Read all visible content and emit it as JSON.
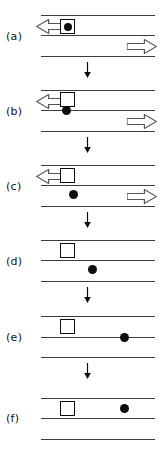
{
  "figure": {
    "width": 167,
    "height": 464,
    "background": "#ffffff",
    "line_color": "#3c3c3c",
    "glyph_color": "#0d0d0d",
    "arrow_outline_color": "#555555",
    "arrow_fill_color": "#ffffff"
  },
  "panels": [
    {
      "label": "(a)",
      "label_x": 6,
      "label_y": 30,
      "top": 0,
      "lines": [
        {
          "x": 41,
          "y": 15,
          "width": 114
        },
        {
          "x": 41,
          "y": 35,
          "width": 114
        },
        {
          "x": 41,
          "y": 56,
          "width": 114
        }
      ],
      "left_arrow": {
        "x": 36,
        "y": 19,
        "width": 30,
        "height": 15,
        "direction": "left"
      },
      "right_arrow": {
        "x": 127,
        "y": 39,
        "width": 30,
        "height": 15,
        "direction": "right"
      },
      "square": {
        "x": 60,
        "y": 19,
        "size": 15,
        "has_inner_circle": true,
        "inner_circle_size": 8
      },
      "circle": null,
      "transition_arrow": {
        "x": 83,
        "y": 62,
        "height": 16
      }
    },
    {
      "label": "(b)",
      "label_x": 6,
      "label_y": 105,
      "top": 0,
      "lines": [
        {
          "x": 41,
          "y": 90,
          "width": 114
        },
        {
          "x": 41,
          "y": 110,
          "width": 114
        },
        {
          "x": 41,
          "y": 131,
          "width": 114
        }
      ],
      "left_arrow": {
        "x": 36,
        "y": 94,
        "width": 30,
        "height": 15,
        "direction": "left"
      },
      "right_arrow": {
        "x": 127,
        "y": 114,
        "width": 30,
        "height": 15,
        "direction": "right"
      },
      "square": {
        "x": 60,
        "y": 92,
        "size": 15,
        "has_inner_circle": false,
        "inner_circle_size": 0
      },
      "circle": {
        "x": 62,
        "y": 106,
        "size": 9
      },
      "transition_arrow": {
        "x": 83,
        "y": 137,
        "height": 16
      }
    },
    {
      "label": "(c)",
      "label_x": 6,
      "label_y": 180,
      "top": 0,
      "lines": [
        {
          "x": 41,
          "y": 165,
          "width": 114
        },
        {
          "x": 41,
          "y": 185,
          "width": 114
        },
        {
          "x": 41,
          "y": 206,
          "width": 114
        }
      ],
      "left_arrow": {
        "x": 36,
        "y": 169,
        "width": 30,
        "height": 15,
        "direction": "left"
      },
      "right_arrow": {
        "x": 127,
        "y": 189,
        "width": 30,
        "height": 15,
        "direction": "right"
      },
      "square": {
        "x": 60,
        "y": 168,
        "size": 15,
        "has_inner_circle": false,
        "inner_circle_size": 0
      },
      "circle": {
        "x": 69,
        "y": 190,
        "size": 9
      },
      "transition_arrow": {
        "x": 83,
        "y": 212,
        "height": 16
      }
    },
    {
      "label": "(d)",
      "label_x": 6,
      "label_y": 255,
      "top": 0,
      "lines": [
        {
          "x": 41,
          "y": 240,
          "width": 114
        },
        {
          "x": 41,
          "y": 260,
          "width": 114
        },
        {
          "x": 41,
          "y": 281,
          "width": 114
        }
      ],
      "left_arrow": null,
      "right_arrow": null,
      "square": {
        "x": 60,
        "y": 243,
        "size": 15,
        "has_inner_circle": false,
        "inner_circle_size": 0
      },
      "circle": {
        "x": 88,
        "y": 265,
        "size": 9
      },
      "transition_arrow": {
        "x": 83,
        "y": 287,
        "height": 16
      }
    },
    {
      "label": "(e)",
      "label_x": 6,
      "label_y": 331,
      "top": 0,
      "lines": [
        {
          "x": 41,
          "y": 316,
          "width": 114
        },
        {
          "x": 41,
          "y": 337,
          "width": 114
        },
        {
          "x": 41,
          "y": 357,
          "width": 114
        }
      ],
      "left_arrow": null,
      "right_arrow": null,
      "square": {
        "x": 60,
        "y": 319,
        "size": 15,
        "has_inner_circle": false,
        "inner_circle_size": 0
      },
      "circle": {
        "x": 120,
        "y": 333,
        "size": 9
      },
      "transition_arrow": {
        "x": 83,
        "y": 363,
        "height": 16
      }
    },
    {
      "label": "(f)",
      "label_x": 6,
      "label_y": 412,
      "top": 0,
      "lines": [
        {
          "x": 41,
          "y": 398,
          "width": 114
        },
        {
          "x": 41,
          "y": 418,
          "width": 114
        },
        {
          "x": 41,
          "y": 439,
          "width": 114
        }
      ],
      "left_arrow": null,
      "right_arrow": null,
      "square": {
        "x": 60,
        "y": 401,
        "size": 15,
        "has_inner_circle": false,
        "inner_circle_size": 0
      },
      "circle": {
        "x": 120,
        "y": 404,
        "size": 9
      },
      "transition_arrow": null
    }
  ]
}
